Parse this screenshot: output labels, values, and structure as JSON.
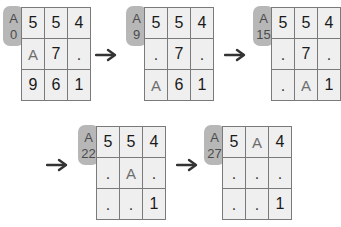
{
  "diagram": {
    "badge_letter": "A",
    "colors": {
      "badge_bg": "#b7b7b7",
      "cell_bg": "#efefef",
      "grid_line": "#7a7a7a",
      "text": "#1a1a1a",
      "dim_text": "#6d6d6d",
      "arrow": "#333333",
      "page_bg": "#ffffff"
    },
    "arrow_glyph": "→",
    "steps": [
      {
        "id": "step-0",
        "badge_letter": "A",
        "badge_number": "0",
        "rows": [
          [
            "5",
            "5",
            "4"
          ],
          [
            "A",
            "7",
            "."
          ],
          [
            "9",
            "6",
            "1"
          ]
        ]
      },
      {
        "id": "step-9",
        "badge_letter": "A",
        "badge_number": "9",
        "rows": [
          [
            "5",
            "5",
            "4"
          ],
          [
            ".",
            "7",
            "."
          ],
          [
            "A",
            "6",
            "1"
          ]
        ]
      },
      {
        "id": "step-15",
        "badge_letter": "A",
        "badge_number": "15",
        "rows": [
          [
            "5",
            "5",
            "4"
          ],
          [
            ".",
            "7",
            "."
          ],
          [
            ".",
            "A",
            "1"
          ]
        ]
      },
      {
        "id": "step-22",
        "badge_letter": "A",
        "badge_number": "22",
        "rows": [
          [
            "5",
            "5",
            "4"
          ],
          [
            ".",
            "A",
            "."
          ],
          [
            ".",
            ".",
            "1"
          ]
        ]
      },
      {
        "id": "step-27",
        "badge_letter": "A",
        "badge_number": "27",
        "rows": [
          [
            "5",
            "A",
            "4"
          ],
          [
            ".",
            ".",
            "."
          ],
          [
            ".",
            ".",
            "1"
          ]
        ]
      }
    ],
    "arrows": [
      {
        "id": "arrow-1",
        "label": "→"
      },
      {
        "id": "arrow-2",
        "label": "→"
      },
      {
        "id": "arrow-3",
        "label": "→"
      },
      {
        "id": "arrow-4",
        "label": "→"
      }
    ]
  }
}
